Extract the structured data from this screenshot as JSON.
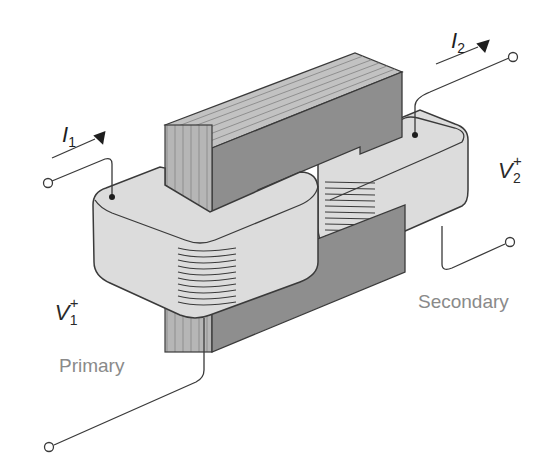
{
  "figure": {
    "labels": {
      "current_primary": {
        "symbol": "I",
        "subscript": "1"
      },
      "current_secondary": {
        "symbol": "I",
        "subscript": "2"
      },
      "voltage_primary": {
        "symbol": "V",
        "superscript": "+",
        "subscript": "1"
      },
      "voltage_secondary": {
        "symbol": "V",
        "superscript": "+",
        "subscript": "2"
      },
      "primary_winding": "Primary",
      "secondary_winding": "Secondary"
    },
    "colors": {
      "core_dark": "#8e8e8e",
      "core_laminations": "#b4b4b4",
      "coil_fill": "#dcdcdc",
      "outline": "#3a3a3a",
      "label_gray": "#8a8a8a"
    }
  }
}
